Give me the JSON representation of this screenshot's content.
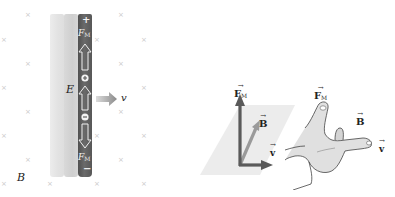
{
  "figure": {
    "left_panel": {
      "field_label": "B",
      "electric_field_label": "E",
      "velocity_label": "v",
      "rod_top_sign": "+",
      "rod_bottom_sign": "−",
      "upper_force_label": "F",
      "upper_force_subscript": "M",
      "lower_force_label": "F",
      "lower_force_subscript": "M",
      "positive_charge_symbol": "+",
      "negative_charge_symbol": "−",
      "field_marker": "×"
    },
    "vector_diagram": {
      "force_label": "F",
      "force_subscript": "M",
      "b_label": "B",
      "v_label": "v",
      "vector_arrow": "→"
    },
    "hand_diagram": {
      "force_label": "F",
      "force_subscript": "M",
      "b_label": "B",
      "v_label": "v",
      "vector_arrow": "→"
    },
    "colors": {
      "dark_rod": "#5e5e5e",
      "light_rod": "#e4e4e4",
      "mid_rod": "#d3d3d3",
      "plane": "#ececec",
      "force_arrow": "#5a5a5a",
      "b_arrow": "#9a9a9a",
      "hand_fill": "#e0e0e0",
      "field_marker": "#c9c9c9"
    }
  }
}
